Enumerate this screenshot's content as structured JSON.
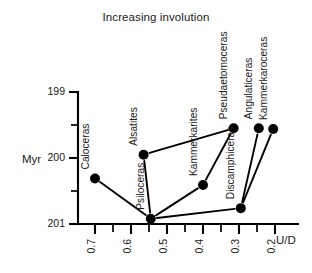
{
  "chart_data": {
    "type": "scatter",
    "title": "Increasing involution",
    "xlabel": "U/D",
    "ylabel": "Myr",
    "xlim": [
      0.75,
      0.17
    ],
    "ylim": [
      201.25,
      198.8
    ],
    "x_axis_reversed": true,
    "y_axis_reversed": true,
    "grid": false,
    "legend": null,
    "xticks": [
      0.7,
      0.6,
      0.5,
      0.4,
      0.3,
      0.2
    ],
    "xticklabels": [
      "0.7",
      "0.6",
      "0.5",
      "0.4",
      "0.3",
      "0.2"
    ],
    "xticks_minor": [
      0.65,
      0.55,
      0.45,
      0.35,
      0.25
    ],
    "yticks": [
      199,
      200,
      201
    ],
    "yticklabels": [
      "199",
      "200",
      "201"
    ],
    "yticks_minor": [
      199.5,
      200.5
    ],
    "points": [
      {
        "name": "Caloceras",
        "x": 0.7,
        "y": 200.31
      },
      {
        "name": "Alsatites",
        "x": 0.565,
        "y": 199.95
      },
      {
        "name": "Psiloceras",
        "x": 0.545,
        "y": 200.92
      },
      {
        "name": "Kammerkarites",
        "x": 0.4,
        "y": 200.41
      },
      {
        "name": "Discamphiceras",
        "x": 0.295,
        "y": 200.76
      },
      {
        "name": "Pseudaetomoceras",
        "x": 0.315,
        "y": 199.55
      },
      {
        "name": "Angulaticeras",
        "x": 0.245,
        "y": 199.55
      },
      {
        "name": "Kammerkaroceras",
        "x": 0.205,
        "y": 199.56
      }
    ],
    "connections": [
      {
        "from": "Psiloceras",
        "to": "Caloceras"
      },
      {
        "from": "Psiloceras",
        "to": "Alsatites"
      },
      {
        "from": "Psiloceras",
        "to": "Kammerkarites"
      },
      {
        "from": "Psiloceras",
        "to": "Discamphiceras"
      },
      {
        "from": "Alsatites",
        "to": "Pseudaetomoceras"
      },
      {
        "from": "Kammerkarites",
        "to": "Pseudaetomoceras"
      },
      {
        "from": "Discamphiceras",
        "to": "Angulaticeras"
      },
      {
        "from": "Discamphiceras",
        "to": "Kammerkaroceras"
      }
    ]
  }
}
